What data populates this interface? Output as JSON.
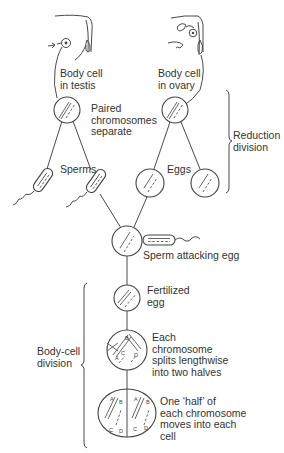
{
  "diagram": {
    "labels": {
      "body_cell_testis": [
        "Body cell",
        "in testis"
      ],
      "body_cell_ovary": [
        "Body cell",
        "in ovary"
      ],
      "paired_chromosomes": [
        "Paired",
        "chromosomes",
        "separate"
      ],
      "reduction_division": [
        "Reduction",
        "division"
      ],
      "sperms": "Sperms",
      "eggs": "Eggs",
      "sperm_attacking_egg": "Sperm attacking egg",
      "fertilized_egg": [
        "Fertilized",
        "egg"
      ],
      "body_cell_division": [
        "Body-cell",
        "division"
      ],
      "each_chromosome_splits": [
        "Each",
        "chromosome",
        "splits lengthwise",
        "into two halves"
      ],
      "one_half_moves": [
        "One ‘half’ of",
        "each chromosome",
        "moves into each",
        "cell"
      ]
    },
    "chromosome_letters": {
      "splitting_cell": [
        "A",
        "B",
        "C",
        "D"
      ],
      "dividing_left": [
        "A",
        "B",
        "C",
        "D"
      ],
      "dividing_right": [
        "A",
        "B",
        "C",
        "D"
      ]
    },
    "stages": [
      {
        "id": "testis-cell",
        "description": "Body cell in testis"
      },
      {
        "id": "ovary-cell",
        "description": "Body cell in ovary"
      },
      {
        "id": "sperm-1"
      },
      {
        "id": "sperm-2"
      },
      {
        "id": "egg-1"
      },
      {
        "id": "egg-2"
      },
      {
        "id": "sperm-attacking-egg"
      },
      {
        "id": "fertilized-egg"
      },
      {
        "id": "splitting-cell"
      },
      {
        "id": "dividing-cell"
      }
    ],
    "colors": {
      "ink": "#444444",
      "background": "#ffffff"
    }
  }
}
